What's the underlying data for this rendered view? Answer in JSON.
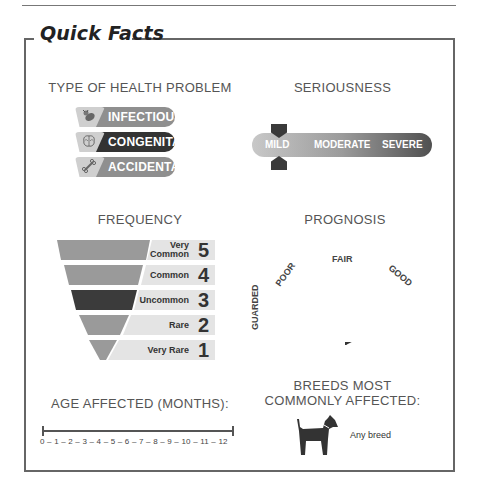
{
  "title": "Quick Facts",
  "health_type": {
    "heading": "TYPE OF HEALTH PROBLEM",
    "items": [
      {
        "label": "INFECTIOUS",
        "icon": "bacteria-icon",
        "selected": false
      },
      {
        "label": "CONGENITAL",
        "icon": "brain-icon",
        "selected": true
      },
      {
        "label": "ACCIDENTAL",
        "icon": "bone-icon",
        "selected": false
      }
    ]
  },
  "seriousness": {
    "heading": "SERIOUSNESS",
    "levels": [
      "MILD",
      "MODERATE",
      "SEVERE"
    ],
    "selected": "MILD"
  },
  "frequency": {
    "heading": "FREQUENCY",
    "levels": [
      {
        "label": "Very Common",
        "line1": "Very",
        "line2": "Common",
        "value": "5"
      },
      {
        "label": "Common",
        "value": "4"
      },
      {
        "label": "Uncommon",
        "value": "3"
      },
      {
        "label": "Rare",
        "value": "2"
      },
      {
        "label": "Very Rare",
        "value": "1"
      }
    ],
    "selected": "Uncommon"
  },
  "prognosis": {
    "heading": "PROGNOSIS",
    "levels": [
      "GUARDED",
      "POOR",
      "FAIR",
      "GOOD",
      "EXCELLENT"
    ],
    "selected": "EXCELLENT"
  },
  "age": {
    "heading": "AGE AFFECTED (MONTHS):",
    "scale": "0 – 1 – 2 – 3 – 4 – 5 – 6 – 7 – 8 – 9 – 10 – 11 – 12",
    "range_start": "0",
    "range_end": "12"
  },
  "breeds": {
    "heading_line1": "BREEDS MOST",
    "heading_line2": "COMMONLY AFFECTED:",
    "value": "Any breed"
  }
}
